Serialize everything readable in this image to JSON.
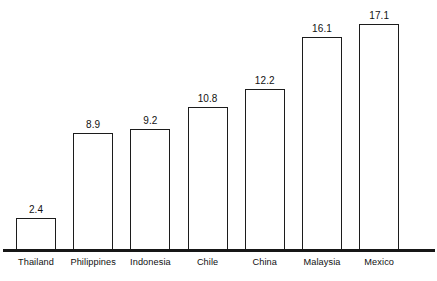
{
  "chart_data": {
    "type": "bar",
    "title": "",
    "xlabel": "",
    "ylabel": "",
    "categories": [
      "Thailand",
      "Philippines",
      "Indonesia",
      "Chile",
      "China",
      "Malaysia",
      "Mexico"
    ],
    "values": [
      2.4,
      8.9,
      9.2,
      10.8,
      12.2,
      16.1,
      17.1
    ],
    "value_labels": [
      "2.4",
      "8.9",
      "9.2",
      "10.8",
      "12.2",
      "16.1",
      "17.1"
    ],
    "ylim": [
      0,
      17.1
    ],
    "grid": false,
    "legend": "none",
    "axis": "baseline-only",
    "bar_style": {
      "fill": "#ffffff",
      "stroke": "#1c1c1c",
      "stroke_width": 1.4
    }
  },
  "caption": {
    "clipped_top_text": ""
  },
  "layout": {
    "baseline_y": 250,
    "pixels_per_unit": 13.2,
    "bar_width": 40,
    "bar_pitch": 57.2,
    "first_bar_left": 16
  }
}
